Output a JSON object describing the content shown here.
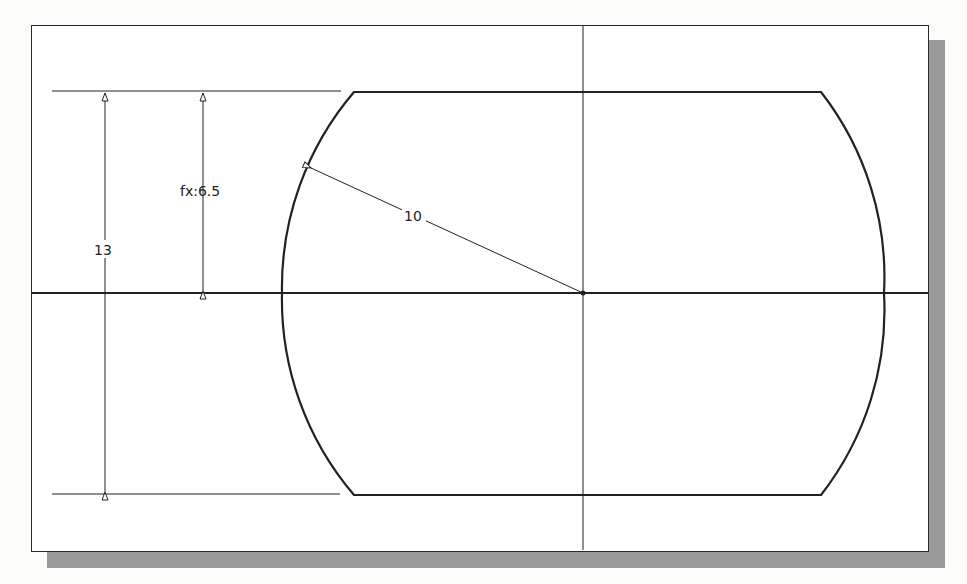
{
  "figure": {
    "type": "2D sketch with dimensions",
    "colors": {
      "line": "#222222",
      "frame_border": "#2a2a2a",
      "shadow": "#9a9a9a",
      "background": "#ffffff"
    },
    "dimensions": {
      "overall_height": {
        "label": "13"
      },
      "half_height": {
        "label": "fx:6.5"
      },
      "arc_radius": {
        "label": "10"
      }
    },
    "geometry": {
      "center": [
        583,
        293
      ],
      "radius_px": 301,
      "top_y": 92,
      "bottom_y": 495,
      "flat_left_x": 354,
      "flat_right_x": 821
    }
  }
}
